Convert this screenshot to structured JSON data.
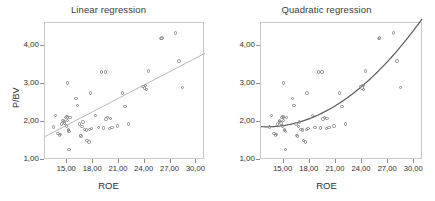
{
  "figure": {
    "xlabel": "ROE",
    "ylabel": "P/BV",
    "panels": [
      {
        "id": "linear",
        "title": "Linear regression",
        "fit": "linear",
        "fit_color": "#b9b9b9"
      },
      {
        "id": "quadratic",
        "title": "Quadratic regression",
        "fit": "quadratic",
        "fit_color": "#5a5a5a"
      }
    ]
  },
  "chart_data": [
    {
      "type": "scatter",
      "title": "Linear regression",
      "xlabel": "ROE",
      "ylabel": "P/BV",
      "xlim": [
        12.4,
        31.0
      ],
      "ylim": [
        1.0,
        4.62
      ],
      "xticks": [
        15,
        18,
        21,
        24,
        27,
        30
      ],
      "xticklabels": [
        "15,00",
        "18,00",
        "21,00",
        "24,00",
        "27,00",
        "30,00"
      ],
      "yticks": [
        1,
        2,
        3,
        4
      ],
      "yticklabels": [
        "1,00",
        "2,00",
        "3,00",
        "4,00"
      ],
      "grid": false,
      "legend": "none",
      "marker": "open-circle",
      "x": [
        13.4,
        13.6,
        13.9,
        14.1,
        14.2,
        14.3,
        14.5,
        14.6,
        14.7,
        14.8,
        14.9,
        14.9,
        15.0,
        15.0,
        15.0,
        15.1,
        15.1,
        15.2,
        15.2,
        15.3,
        16.0,
        16.2,
        16.4,
        16.5,
        16.6,
        16.7,
        16.8,
        17.0,
        17.2,
        17.3,
        17.5,
        17.6,
        17.7,
        17.8,
        18.3,
        18.6,
        19.0,
        19.2,
        19.4,
        19.5,
        19.7,
        19.9,
        20.0,
        20.2,
        20.8,
        21.4,
        21.7,
        22.1,
        23.8,
        24.0,
        24.1,
        24.2,
        24.4,
        25.9,
        26.0,
        27.6,
        28.0,
        28.4
      ],
      "y": [
        1.87,
        2.18,
        1.7,
        1.66,
        1.68,
        1.95,
        2.05,
        2.01,
        1.98,
        2.12,
        2.15,
        1.9,
        3.03,
        2.14,
        2.05,
        1.8,
        1.78,
        1.76,
        1.27,
        2.13,
        2.62,
        2.44,
        1.95,
        1.65,
        1.63,
        1.88,
        2.0,
        1.8,
        1.79,
        1.52,
        1.48,
        1.81,
        2.77,
        1.83,
        2.17,
        1.86,
        3.33,
        1.85,
        3.32,
        2.08,
        2.12,
        1.84,
        2.1,
        1.86,
        1.9,
        2.77,
        2.41,
        1.95,
        2.95,
        2.9,
        2.97,
        2.86,
        3.35,
        4.21,
        4.22,
        4.36,
        3.62,
        2.91
      ],
      "fit": {
        "kind": "linear",
        "color": "#b9b9b9",
        "endpoints": [
          [
            12.4,
            1.62
          ],
          [
            31.0,
            3.82
          ]
        ]
      }
    },
    {
      "type": "scatter",
      "title": "Quadratic regression",
      "xlabel": "ROE",
      "ylabel": "P/BV",
      "xlim": [
        12.4,
        31.0
      ],
      "ylim": [
        1.0,
        4.62
      ],
      "xticks": [
        15,
        18,
        21,
        24,
        27,
        30
      ],
      "xticklabels": [
        "15,00",
        "18,00",
        "21,00",
        "24,00",
        "27,00",
        "30,00"
      ],
      "yticks": [
        1,
        2,
        3,
        4
      ],
      "yticklabels": [
        "1,00",
        "2,00",
        "3,00",
        "4,00"
      ],
      "grid": false,
      "legend": "none",
      "marker": "open-circle",
      "x": [
        13.4,
        13.6,
        13.9,
        14.1,
        14.2,
        14.3,
        14.5,
        14.6,
        14.7,
        14.8,
        14.9,
        14.9,
        15.0,
        15.0,
        15.0,
        15.1,
        15.1,
        15.2,
        15.2,
        15.3,
        16.0,
        16.2,
        16.4,
        16.5,
        16.6,
        16.7,
        16.8,
        17.0,
        17.2,
        17.3,
        17.5,
        17.6,
        17.7,
        17.8,
        18.3,
        18.6,
        19.0,
        19.2,
        19.4,
        19.5,
        19.7,
        19.9,
        20.0,
        20.2,
        20.8,
        21.4,
        21.7,
        22.1,
        23.8,
        24.0,
        24.1,
        24.2,
        24.4,
        25.9,
        26.0,
        27.6,
        28.0,
        28.4
      ],
      "y": [
        1.87,
        2.18,
        1.7,
        1.66,
        1.68,
        1.95,
        2.05,
        2.01,
        1.98,
        2.12,
        2.15,
        1.9,
        3.03,
        2.14,
        2.05,
        1.8,
        1.78,
        1.76,
        1.27,
        2.13,
        2.62,
        2.44,
        1.95,
        1.65,
        1.63,
        1.88,
        2.0,
        1.8,
        1.79,
        1.52,
        1.48,
        1.81,
        2.77,
        1.83,
        2.17,
        1.86,
        3.33,
        1.85,
        3.32,
        2.08,
        2.12,
        1.84,
        2.1,
        1.86,
        1.9,
        2.77,
        2.41,
        1.95,
        2.95,
        2.9,
        2.97,
        2.86,
        3.35,
        4.21,
        4.22,
        4.36,
        3.62,
        2.91
      ],
      "fit": {
        "kind": "quadratic",
        "color": "#5a5a5a",
        "coefficients": {
          "a": 0.00895,
          "b": -0.2335,
          "c": 3.4
        }
      }
    }
  ]
}
